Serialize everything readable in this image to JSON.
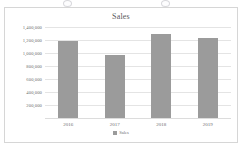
{
  "chart_data": {
    "type": "bar",
    "title": "Sales",
    "xlabel": "",
    "ylabel": "",
    "categories": [
      "2016",
      "2017",
      "2018",
      "2019"
    ],
    "series": [
      {
        "name": "Sales",
        "values": [
          1180000,
          970000,
          1290000,
          1230000
        ],
        "color": "#9b9b9b"
      }
    ],
    "ylim": [
      0,
      1400000
    ],
    "ytick_values": [
      1400000,
      1200000,
      1000000,
      800000,
      600000,
      400000,
      200000
    ],
    "ytick_labels": [
      "1,400,000",
      "1,200,000",
      "1,000,000",
      "800,000",
      "600,000",
      "400,000",
      "200,000"
    ],
    "grid": true,
    "legend": {
      "position": "bottom",
      "entries": [
        {
          "label": "Sales",
          "color": "#9b9b9b"
        }
      ]
    }
  },
  "colors": {
    "bar": "#9b9b9b",
    "gridline": "#e4e4e4",
    "frame_border": "#d6d6d6",
    "title_text": "#59595b",
    "tick_text": "#6e6e70",
    "background": "#ffffff"
  }
}
